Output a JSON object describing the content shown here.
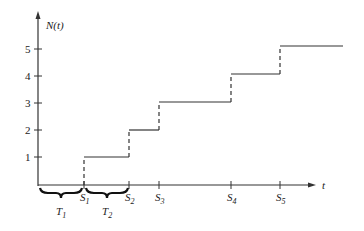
{
  "diagram": {
    "y_axis_label": "N(t)",
    "x_axis_label": "t",
    "y_ticks": [
      "1",
      "2",
      "3",
      "4",
      "5"
    ],
    "x_ticks": [
      {
        "label": "S",
        "sub": "1"
      },
      {
        "label": "S",
        "sub": "2"
      },
      {
        "label": "S",
        "sub": "3"
      },
      {
        "label": "S",
        "sub": "4"
      },
      {
        "label": "S",
        "sub": "5"
      }
    ],
    "braces": [
      {
        "label": "T",
        "sub": "1"
      },
      {
        "label": "T",
        "sub": "2"
      }
    ],
    "colors": {
      "line": "#333333",
      "background": "#ffffff"
    }
  }
}
